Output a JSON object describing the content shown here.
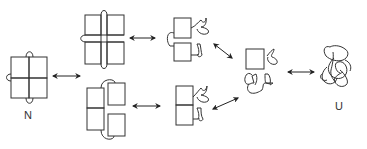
{
  "diagram": {
    "labels": {
      "native": "N",
      "unfolded": "U"
    },
    "stroke_color": "#333333",
    "background": "#ffffff",
    "nodes": [
      {
        "id": "N",
        "label": "N",
        "desc": "native 2x2 block with three loops"
      },
      {
        "id": "I1a",
        "label": "",
        "desc": "upper intermediate: separated 2x2 squares with threaded loops"
      },
      {
        "id": "I1b",
        "label": "",
        "desc": "lower intermediate: split 2x2 with top and bottom loops"
      },
      {
        "id": "I2a",
        "label": "",
        "desc": "upper partially unfolded: two squares with disordered segments"
      },
      {
        "id": "I2b",
        "label": "",
        "desc": "lower partially unfolded: stacked squares with disordered segments"
      },
      {
        "id": "I3",
        "label": "",
        "desc": "mostly unfolded: single square with disordered chain"
      },
      {
        "id": "U",
        "label": "U",
        "desc": "unfolded random coil"
      }
    ],
    "edges": [
      {
        "from": "N",
        "to": "I1a",
        "type": "bidirectional"
      },
      {
        "from": "N",
        "to": "I1b",
        "type": "bidirectional"
      },
      {
        "from": "I1a",
        "to": "I2a",
        "type": "bidirectional"
      },
      {
        "from": "I1b",
        "to": "I2b",
        "type": "bidirectional"
      },
      {
        "from": "I2a",
        "to": "I3",
        "type": "bidirectional"
      },
      {
        "from": "I2b",
        "to": "I3",
        "type": "bidirectional"
      },
      {
        "from": "I3",
        "to": "U",
        "type": "bidirectional"
      }
    ]
  }
}
